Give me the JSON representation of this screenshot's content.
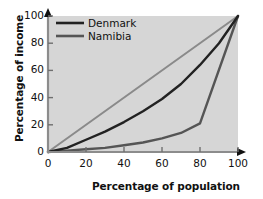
{
  "chart_data": {
    "type": "line",
    "title": "",
    "xlabel": "Percentage of population",
    "ylabel": "Percentage of income",
    "xlim": [
      0,
      100
    ],
    "ylim": [
      0,
      100
    ],
    "xticks": [
      "0",
      "20",
      "40",
      "60",
      "80",
      "100"
    ],
    "yticks": [
      "0",
      "20",
      "40",
      "60",
      "80",
      "100"
    ],
    "xtick_values": [
      0,
      20,
      40,
      60,
      80,
      100
    ],
    "ytick_values": [
      0,
      20,
      40,
      60,
      80,
      100
    ],
    "grid": false,
    "legend_position": "top-left",
    "plot_background": "#d6d6d6",
    "series": [
      {
        "name": "line-of-equality",
        "label": "",
        "color": "#8a8a8a",
        "width": 2.0,
        "in_legend": false,
        "x": [
          0,
          100
        ],
        "values": [
          0,
          100
        ]
      },
      {
        "name": "Denmark",
        "label": "Denmark",
        "color": "#222222",
        "width": 2.4,
        "in_legend": true,
        "x": [
          0,
          10,
          20,
          30,
          40,
          50,
          60,
          70,
          80,
          90,
          100
        ],
        "values": [
          0,
          3,
          9,
          15,
          22,
          30,
          39,
          50,
          64,
          80,
          100
        ]
      },
      {
        "name": "Namibia",
        "label": "Namibia",
        "color": "#555555",
        "width": 2.4,
        "in_legend": true,
        "x": [
          0,
          10,
          20,
          30,
          40,
          50,
          60,
          70,
          80,
          100
        ],
        "values": [
          0,
          1,
          2,
          3,
          5,
          7,
          10,
          14,
          21,
          100
        ]
      }
    ],
    "legend_entries": [
      {
        "label": "Denmark",
        "color": "#222222"
      },
      {
        "label": "Namibia",
        "color": "#555555"
      }
    ],
    "axis_arrows": true,
    "tick_direction": "in"
  }
}
